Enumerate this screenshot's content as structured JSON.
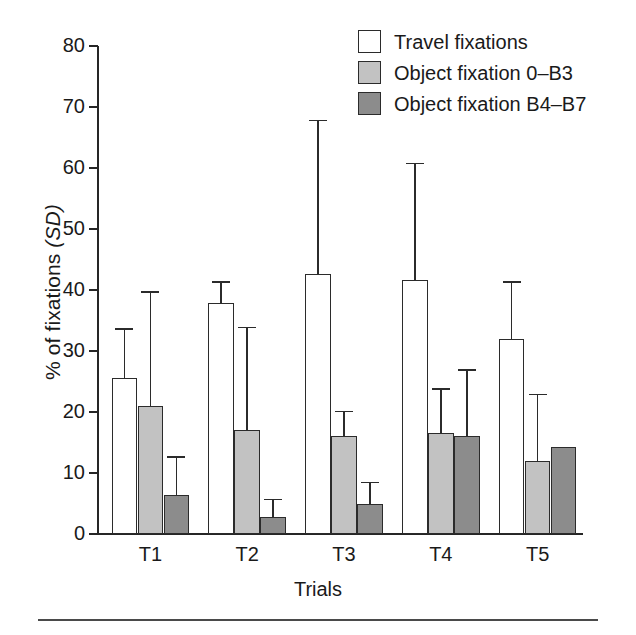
{
  "chart_data": {
    "type": "bar",
    "title": "",
    "xlabel": "Trials",
    "ylabel": "% of fixations (SD)",
    "ylabel_plain": "% of fixations",
    "ylabel_italic": "(SD)",
    "categories": [
      "T1",
      "T2",
      "T3",
      "T4",
      "T5"
    ],
    "ylim": [
      0,
      80
    ],
    "yticks": [
      0,
      10,
      20,
      30,
      40,
      50,
      60,
      70,
      80
    ],
    "ytick_labels": [
      "0",
      "10",
      "20",
      "30",
      "40",
      "50",
      "60",
      "70",
      "80"
    ],
    "grid": false,
    "legend_position": "top-right",
    "error_bars": "SD, upper only",
    "series": [
      {
        "name": "Travel fixations",
        "color": "#ffffff",
        "values": [
          25.5,
          37.8,
          42.7,
          41.6,
          32.0
        ],
        "errors": [
          8.3,
          3.6,
          25.2,
          19.3,
          9.5
        ]
      },
      {
        "name": "Object fixation 0–B3",
        "color": "#c2c2c2",
        "values": [
          21.0,
          17.0,
          16.0,
          16.5,
          12.0
        ],
        "errors": [
          18.8,
          17.0,
          4.2,
          7.4,
          11.0
        ]
      },
      {
        "name": "Object fixation B4–B7",
        "color": "#8c8c8c",
        "values": [
          6.4,
          2.8,
          4.9,
          16.0,
          14.2
        ],
        "errors": [
          6.4,
          3.0,
          3.7,
          11.0,
          null
        ]
      }
    ]
  },
  "legend": {
    "items": [
      {
        "label": "Travel fixations",
        "swatch": "white"
      },
      {
        "label": "Object fixation 0–B3",
        "swatch": "light"
      },
      {
        "label": "Object fixation B4–B7",
        "swatch": "dark"
      }
    ]
  }
}
